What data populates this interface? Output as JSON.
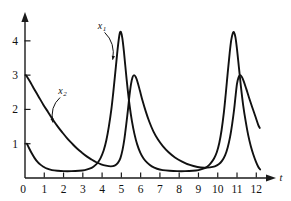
{
  "chart_data": {
    "type": "line",
    "title": "",
    "subtitle": "",
    "xlabel": "t",
    "ylabel": "",
    "xlim": [
      0,
      12.4
    ],
    "ylim": [
      0,
      4.55
    ],
    "grid": false,
    "legend_position": "inline-annotations",
    "x_ticks": [
      0,
      1,
      2,
      3,
      4,
      5,
      6,
      7,
      8,
      9,
      10,
      11,
      12
    ],
    "x_tick_labels": [
      "0",
      "1",
      "2",
      "3",
      "4",
      "5",
      "6",
      "7",
      "8",
      "9",
      "10",
      "11",
      "12"
    ],
    "y_ticks": [
      1,
      2,
      3,
      4
    ],
    "y_tick_labels": [
      "1",
      "2",
      "3",
      "4"
    ],
    "annotations": [
      {
        "name": "x1",
        "text": "x",
        "subscript": "1",
        "label_x": 4.0,
        "label_y": 4.35,
        "points_to_x": 4.55,
        "points_to_y": 3.45
      },
      {
        "name": "x2",
        "text": "x",
        "subscript": "2",
        "label_x": 1.95,
        "label_y": 2.45,
        "points_to_x": 1.45,
        "points_to_y": 1.62
      }
    ],
    "series": [
      {
        "name": "x1",
        "label": "x1",
        "color": "#111111",
        "description": "sharp tall spikes, peak about 4.25",
        "peaks": [
          {
            "x": 4.9,
            "y": 4.25
          },
          {
            "x": 10.4,
            "y": 4.25
          }
        ],
        "start": {
          "x": 0.1,
          "y": 1.0
        },
        "end": {
          "x": 12.1,
          "y": 0.2
        },
        "baseline": 0.2,
        "points": [
          [
            0.1,
            1.0
          ],
          [
            0.22,
            0.86
          ],
          [
            0.35,
            0.72
          ],
          [
            0.5,
            0.58
          ],
          [
            0.65,
            0.47
          ],
          [
            0.8,
            0.39
          ],
          [
            0.95,
            0.33
          ],
          [
            1.15,
            0.27
          ],
          [
            1.4,
            0.23
          ],
          [
            1.7,
            0.21
          ],
          [
            2.0,
            0.2
          ],
          [
            2.4,
            0.2
          ],
          [
            2.8,
            0.21
          ],
          [
            3.1,
            0.23
          ],
          [
            3.35,
            0.27
          ],
          [
            3.55,
            0.33
          ],
          [
            3.75,
            0.43
          ],
          [
            3.92,
            0.58
          ],
          [
            4.08,
            0.8
          ],
          [
            4.22,
            1.1
          ],
          [
            4.35,
            1.5
          ],
          [
            4.48,
            2.0
          ],
          [
            4.58,
            2.5
          ],
          [
            4.68,
            3.05
          ],
          [
            4.78,
            3.62
          ],
          [
            4.86,
            4.02
          ],
          [
            4.92,
            4.23
          ],
          [
            4.98,
            4.25
          ],
          [
            5.05,
            4.08
          ],
          [
            5.13,
            3.7
          ],
          [
            5.22,
            3.18
          ],
          [
            5.32,
            2.62
          ],
          [
            5.43,
            2.1
          ],
          [
            5.55,
            1.65
          ],
          [
            5.68,
            1.28
          ],
          [
            5.82,
            0.98
          ],
          [
            5.98,
            0.74
          ],
          [
            6.15,
            0.57
          ],
          [
            6.35,
            0.44
          ],
          [
            6.58,
            0.34
          ],
          [
            6.85,
            0.27
          ],
          [
            7.15,
            0.23
          ],
          [
            7.5,
            0.21
          ],
          [
            7.9,
            0.2
          ],
          [
            8.3,
            0.2
          ],
          [
            8.7,
            0.21
          ],
          [
            9.0,
            0.23
          ],
          [
            9.25,
            0.27
          ],
          [
            9.45,
            0.33
          ],
          [
            9.62,
            0.42
          ],
          [
            9.8,
            0.56
          ],
          [
            9.95,
            0.75
          ],
          [
            10.08,
            1.02
          ],
          [
            10.2,
            1.4
          ],
          [
            10.32,
            1.92
          ],
          [
            10.42,
            2.48
          ],
          [
            10.52,
            3.08
          ],
          [
            10.62,
            3.65
          ],
          [
            10.7,
            4.02
          ],
          [
            10.78,
            4.22
          ],
          [
            10.84,
            4.25
          ],
          [
            10.92,
            4.1
          ],
          [
            11.0,
            3.75
          ],
          [
            11.1,
            3.22
          ],
          [
            11.2,
            2.68
          ],
          [
            11.32,
            2.12
          ],
          [
            11.45,
            1.65
          ],
          [
            11.58,
            1.25
          ],
          [
            11.72,
            0.92
          ],
          [
            11.85,
            0.68
          ],
          [
            11.98,
            0.48
          ],
          [
            12.1,
            0.33
          ],
          [
            12.2,
            0.25
          ]
        ]
      },
      {
        "name": "x2",
        "label": "x2",
        "color": "#111111",
        "description": "broader lower peaks, peak about 3.0, starts at 3",
        "peaks": [
          {
            "x": 5.5,
            "y": 3.0
          },
          {
            "x": 11.0,
            "y": 3.0
          }
        ],
        "start": {
          "x": 0.05,
          "y": 3.0
        },
        "end": {
          "x": 12.1,
          "y": 1.5
        },
        "baseline": 0.22,
        "points": [
          [
            0.05,
            3.0
          ],
          [
            0.25,
            2.82
          ],
          [
            0.45,
            2.62
          ],
          [
            0.7,
            2.38
          ],
          [
            0.95,
            2.14
          ],
          [
            1.2,
            1.92
          ],
          [
            1.45,
            1.7
          ],
          [
            1.7,
            1.5
          ],
          [
            1.95,
            1.32
          ],
          [
            2.2,
            1.15
          ],
          [
            2.45,
            1.0
          ],
          [
            2.7,
            0.86
          ],
          [
            2.95,
            0.74
          ],
          [
            3.2,
            0.63
          ],
          [
            3.45,
            0.54
          ],
          [
            3.7,
            0.46
          ],
          [
            3.95,
            0.4
          ],
          [
            4.2,
            0.36
          ],
          [
            4.45,
            0.34
          ],
          [
            4.65,
            0.36
          ],
          [
            4.82,
            0.44
          ],
          [
            4.95,
            0.58
          ],
          [
            5.06,
            0.82
          ],
          [
            5.16,
            1.15
          ],
          [
            5.25,
            1.55
          ],
          [
            5.34,
            1.98
          ],
          [
            5.42,
            2.4
          ],
          [
            5.5,
            2.74
          ],
          [
            5.58,
            2.94
          ],
          [
            5.66,
            3.0
          ],
          [
            5.75,
            2.94
          ],
          [
            5.85,
            2.78
          ],
          [
            5.96,
            2.55
          ],
          [
            6.1,
            2.25
          ],
          [
            6.26,
            1.95
          ],
          [
            6.45,
            1.64
          ],
          [
            6.66,
            1.36
          ],
          [
            6.9,
            1.12
          ],
          [
            7.15,
            0.93
          ],
          [
            7.45,
            0.75
          ],
          [
            7.78,
            0.6
          ],
          [
            8.15,
            0.48
          ],
          [
            8.55,
            0.38
          ],
          [
            8.95,
            0.32
          ],
          [
            9.3,
            0.3
          ],
          [
            9.6,
            0.31
          ],
          [
            9.85,
            0.34
          ],
          [
            10.05,
            0.4
          ],
          [
            10.22,
            0.5
          ],
          [
            10.38,
            0.66
          ],
          [
            10.52,
            0.9
          ],
          [
            10.64,
            1.2
          ],
          [
            10.75,
            1.58
          ],
          [
            10.85,
            2.0
          ],
          [
            10.93,
            2.42
          ],
          [
            11.0,
            2.75
          ],
          [
            11.08,
            2.94
          ],
          [
            11.16,
            3.0
          ],
          [
            11.25,
            2.95
          ],
          [
            11.35,
            2.82
          ],
          [
            11.48,
            2.6
          ],
          [
            11.62,
            2.35
          ],
          [
            11.78,
            2.08
          ],
          [
            11.95,
            1.8
          ],
          [
            12.1,
            1.55
          ],
          [
            12.18,
            1.46
          ]
        ]
      }
    ]
  }
}
